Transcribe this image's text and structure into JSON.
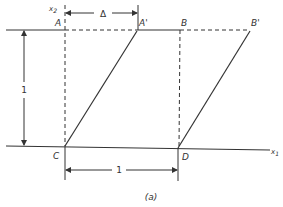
{
  "diagram": {
    "caption": "(a)",
    "axes": {
      "x_label": "x",
      "x_sub": "1",
      "y_label": "x",
      "y_sub": "2"
    },
    "points": {
      "A": "A",
      "A_prime": "A'",
      "B": "B",
      "B_prime": "B'",
      "C": "C",
      "D": "D"
    },
    "dimensions": {
      "shear": "Δ",
      "height": "1",
      "width": "1"
    },
    "colors": {
      "line": "#333333",
      "background": "#ffffff"
    }
  }
}
